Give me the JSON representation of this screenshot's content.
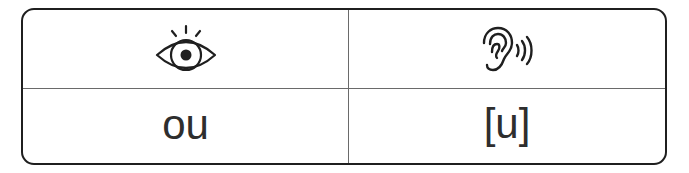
{
  "table": {
    "headers": [
      {
        "icon": "eye-icon",
        "meaning": "see / written form"
      },
      {
        "icon": "ear-icon",
        "meaning": "hear / sound"
      }
    ],
    "row": {
      "spelling": "ou",
      "sound": "[u]"
    }
  },
  "colors": {
    "border": "#1f1f1f",
    "divider": "#6a6a6a",
    "text": "#2e2e2e"
  }
}
